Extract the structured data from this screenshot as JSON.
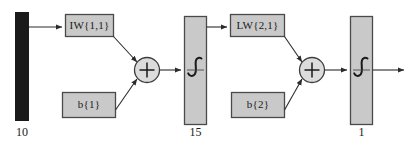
{
  "diagram": {
    "colors": {
      "input_bar_fill": "#1a1a1a",
      "box_fill": "#c9c9c9",
      "box_stroke": "#4a4a4a",
      "line": "#2b2b2b",
      "text": "#1a1a1a",
      "background": "#ffffff"
    },
    "input": {
      "name": "input-vector",
      "size_label": "10"
    },
    "layer1": {
      "weight_label": "IW{1,1}",
      "bias_label": "b{1}",
      "sum_symbol": "+",
      "transfer_symbol": "sigmoid-curve",
      "size_label": "15"
    },
    "layer2": {
      "weight_label": "LW{2,1}",
      "bias_label": "b{2}",
      "sum_symbol": "+",
      "transfer_symbol": "sigmoid-curve",
      "size_label": "1"
    }
  }
}
